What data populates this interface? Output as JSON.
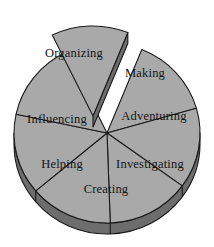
{
  "chart_data": {
    "type": "pie",
    "title": "",
    "subtitle": "",
    "xlabel": "",
    "ylabel": "",
    "legend": "none",
    "grid": false,
    "exploded_slices": [
      "Organizing"
    ],
    "style": {
      "effect": "3d",
      "slice_fill": "#a9a9a9",
      "slice_stroke": "#1a1a1a",
      "depth_fill": "#6d6d6d",
      "depth_stroke": "#1a1a1a",
      "background": "#ffffff",
      "label_color": "#141414"
    },
    "categories": [
      "Making",
      "Adventuring",
      "Investigating",
      "Creating",
      "Helping",
      "Influencing",
      "Organizing"
    ],
    "values": [
      14.3,
      14.3,
      14.3,
      14.3,
      14.3,
      14.3,
      14.3
    ],
    "slices": [
      {
        "label": "Making",
        "value": 14.3,
        "start_deg": -68,
        "end_deg": -16,
        "exploded": false
      },
      {
        "label": "Adventuring",
        "value": 14.3,
        "start_deg": -16,
        "end_deg": 36,
        "exploded": false
      },
      {
        "label": "Investigating",
        "value": 14.3,
        "start_deg": 36,
        "end_deg": 88,
        "exploded": false
      },
      {
        "label": "Creating",
        "value": 14.3,
        "start_deg": 88,
        "end_deg": 140,
        "exploded": false
      },
      {
        "label": "Helping",
        "value": 14.3,
        "start_deg": 140,
        "end_deg": 192,
        "exploded": false
      },
      {
        "label": "Influencing",
        "value": 14.3,
        "start_deg": 192,
        "end_deg": 244,
        "exploded": false
      },
      {
        "label": "Organizing",
        "value": 14.3,
        "start_deg": 244,
        "end_deg": 292,
        "exploded": true
      }
    ]
  },
  "labels": {
    "making": "Making",
    "adventuring": "Adventuring",
    "investigating": "Investigating",
    "creating": "Creating",
    "helping": "Helping",
    "influencing": "Influencing",
    "organizing": "Organizing"
  }
}
